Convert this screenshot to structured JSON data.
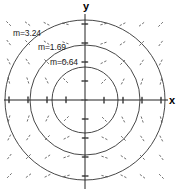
{
  "chart_data": {
    "type": "scatter",
    "plot_kind": "vector-field-with-level-curves",
    "title": "",
    "subtitle": "",
    "xlabel": "x",
    "ylabel": "y",
    "grid": false,
    "legend": "none",
    "xlim": [
      -4.5,
      4.8
    ],
    "ylim": [
      -4.7,
      4.6
    ],
    "xticks": [
      -4,
      -3,
      -2,
      -1,
      1,
      2,
      3,
      4
    ],
    "yticks": [
      -4,
      -3,
      -2,
      -1,
      1,
      2,
      3,
      4
    ],
    "tick_labels_shown": false,
    "axes_origin": [
      0,
      0
    ],
    "annotations": [
      {
        "text": "m=3.24",
        "value": 3.24,
        "radius": 1.8,
        "x": -2.95,
        "y": 3.2
      },
      {
        "text": "m=1.69",
        "value": 1.69,
        "radius": 1.3,
        "x": -1.6,
        "y": 2.45
      },
      {
        "text": "m=0.64",
        "value": 0.64,
        "radius": 0.8,
        "x": -1.0,
        "y": 1.65
      }
    ],
    "level_curves": [
      {
        "label": "m=3.24",
        "value": 3.24,
        "shape": "circle",
        "center": [
          0,
          0
        ],
        "radius": 1.8,
        "radius_px": 80
      },
      {
        "label": "m=1.69",
        "value": 1.69,
        "shape": "circle",
        "center": [
          0,
          0
        ],
        "radius": 1.3,
        "radius_px": 55
      },
      {
        "label": "m=0.64",
        "value": 0.64,
        "shape": "circle",
        "center": [
          0,
          0
        ],
        "radius": 0.8,
        "radius_px": 33
      }
    ],
    "field": {
      "description": "dashed short line segments (slope/direction field) tangent to circular level curves",
      "grid_cols": 9,
      "grid_rows": 9,
      "segment_style": "dashed",
      "segment_color": "#555555"
    },
    "colors": {
      "axis": "#222222",
      "curve": "#333333",
      "field": "#555555",
      "background": "#ffffff",
      "text": "#000000"
    }
  },
  "axis_labels": {
    "y": "y",
    "x": "x"
  },
  "labels": {
    "outer": "m=3.24",
    "middle": "m=1.69",
    "inner": "m=0.64"
  }
}
